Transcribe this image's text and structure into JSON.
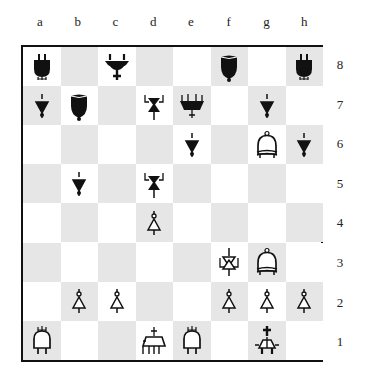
{
  "board": {
    "files": [
      "a",
      "b",
      "c",
      "d",
      "e",
      "f",
      "g",
      "h"
    ],
    "ranks": [
      "8",
      "7",
      "6",
      "5",
      "4",
      "3",
      "2",
      "1"
    ],
    "colors": {
      "light": "#ffffff",
      "dark": "#e6e6e6",
      "border": "#111111",
      "black_piece": "#111111",
      "white_piece": "#ffffff"
    },
    "pieces": [
      {
        "square": "a8",
        "color": "black",
        "type": "rook"
      },
      {
        "square": "c8",
        "color": "black",
        "type": "king"
      },
      {
        "square": "f8",
        "color": "black",
        "type": "bishop"
      },
      {
        "square": "h8",
        "color": "black",
        "type": "rook"
      },
      {
        "square": "a7",
        "color": "black",
        "type": "pawn"
      },
      {
        "square": "b7",
        "color": "black",
        "type": "bishop"
      },
      {
        "square": "d7",
        "color": "black",
        "type": "knight"
      },
      {
        "square": "e7",
        "color": "black",
        "type": "queen"
      },
      {
        "square": "g7",
        "color": "black",
        "type": "pawn"
      },
      {
        "square": "e6",
        "color": "black",
        "type": "pawn"
      },
      {
        "square": "g6",
        "color": "white",
        "type": "bishop"
      },
      {
        "square": "h6",
        "color": "black",
        "type": "pawn"
      },
      {
        "square": "b5",
        "color": "black",
        "type": "pawn"
      },
      {
        "square": "d5",
        "color": "black",
        "type": "knight"
      },
      {
        "square": "d4",
        "color": "white",
        "type": "pawn"
      },
      {
        "square": "f3",
        "color": "white",
        "type": "knight"
      },
      {
        "square": "g3",
        "color": "white",
        "type": "bishop"
      },
      {
        "square": "b2",
        "color": "white",
        "type": "pawn"
      },
      {
        "square": "c2",
        "color": "white",
        "type": "pawn"
      },
      {
        "square": "f2",
        "color": "white",
        "type": "pawn"
      },
      {
        "square": "g2",
        "color": "white",
        "type": "pawn"
      },
      {
        "square": "h2",
        "color": "white",
        "type": "pawn"
      },
      {
        "square": "a1",
        "color": "white",
        "type": "rook"
      },
      {
        "square": "d1",
        "color": "white",
        "type": "queen"
      },
      {
        "square": "e1",
        "color": "white",
        "type": "rook"
      },
      {
        "square": "g1",
        "color": "white",
        "type": "king"
      }
    ]
  }
}
